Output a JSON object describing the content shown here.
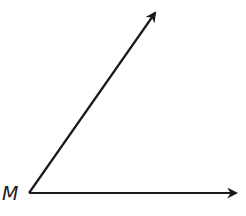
{
  "diagram": {
    "type": "angle",
    "vertex": {
      "label": "M",
      "x": 29,
      "y": 193
    },
    "rays": [
      {
        "name": "upper-ray",
        "from": [
          29,
          193
        ],
        "to": [
          155,
          13
        ]
      },
      {
        "name": "horizontal-ray",
        "from": [
          29,
          193
        ],
        "to": [
          236,
          193
        ]
      }
    ],
    "stroke_color": "#1a1a1a",
    "background": "#ffffff"
  }
}
